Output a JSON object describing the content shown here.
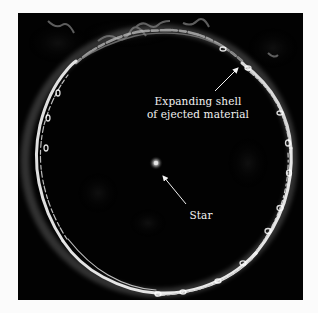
{
  "figure": {
    "background_color": "#020202",
    "ring_color": "#e6e6e6",
    "annotations": {
      "shell": {
        "line1": "Expanding shell",
        "line2": "of ejected material"
      },
      "star": {
        "label": "Star"
      }
    }
  }
}
